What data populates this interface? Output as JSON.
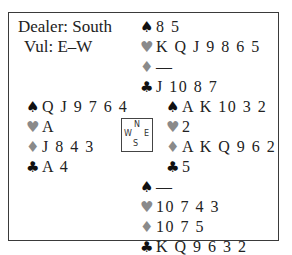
{
  "deal": {
    "dealer_label": "Dealer: South",
    "vul_label": "Vul: E–W",
    "suit_symbols": {
      "spades": "♠",
      "hearts": "♥",
      "diamonds": "♦",
      "clubs": "♣"
    },
    "suit_colors": {
      "spades": "#111111",
      "hearts": "#8a8a8a",
      "diamonds": "#8a8a8a",
      "clubs": "#111111"
    },
    "compass": {
      "n": "N",
      "w": "W",
      "e": "E",
      "s": "S"
    },
    "hands": {
      "north": {
        "spades": "8 5",
        "hearts": "K Q J 9 8 6 5",
        "diamonds": "—",
        "clubs": "J 10 8 7"
      },
      "west": {
        "spades": "Q J 9 7 6 4",
        "hearts": "A",
        "diamonds": "J 8 4 3",
        "clubs": "A 4"
      },
      "east": {
        "spades": "A K 10 3 2",
        "hearts": "2",
        "diamonds": "A K Q 9 6 2",
        "clubs": "5"
      },
      "south": {
        "spades": "—",
        "hearts": "10 7 4 3",
        "diamonds": "10 7 5",
        "clubs": "K Q 9 6 3 2"
      }
    }
  }
}
